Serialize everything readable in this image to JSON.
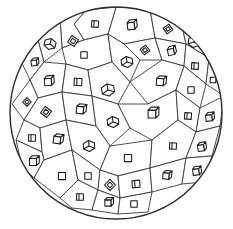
{
  "figure": {
    "background_color": "#ffffff",
    "stroke_color": "#2b2b2b",
    "cell_stroke_color": "#3a3a3a",
    "cube_stroke_color": "#1a1a1a",
    "boundary": {
      "shape": "circle",
      "center_x": 116,
      "center_y": 113,
      "radius": 106,
      "stroke_width": 1.4
    },
    "cell_count": 36,
    "cube_count": 36,
    "cells": [
      {
        "id": 1,
        "points": "116,7 150,9 155,38 124,44 108,34",
        "cube": {
          "x": 131,
          "y": 26,
          "size": 9,
          "style": "box-front",
          "rot": -6
        }
      },
      {
        "id": 2,
        "points": "150,9 180,17 186,44 155,38",
        "cube": {
          "x": 168,
          "y": 29,
          "size": 8,
          "style": "diamond",
          "rot": 10
        }
      },
      {
        "id": 3,
        "points": "180,17 205,33 209,58 186,44",
        "cube": {
          "x": 194,
          "y": 42,
          "size": 9,
          "style": "box-iso",
          "rot": 8
        }
      },
      {
        "id": 4,
        "points": "205,33 219,58 214,80 209,58",
        "cube": {
          "x": 211,
          "y": 57,
          "size": 7,
          "style": "box-front",
          "rot": -10
        }
      },
      {
        "id": 5,
        "points": "86,10 116,7 108,34 84,40 74,24",
        "cube": {
          "x": 95,
          "y": 24,
          "size": 8,
          "style": "box-flat",
          "rot": 4
        }
      },
      {
        "id": 6,
        "points": "60,18 86,10 74,24 84,40 62,48",
        "cube": {
          "x": 73,
          "y": 41,
          "size": 9,
          "style": "diamond",
          "rot": -12
        }
      },
      {
        "id": 7,
        "points": "36,33 60,18 62,48 44,62",
        "cube": {
          "x": 50,
          "y": 44,
          "size": 9,
          "style": "box-iso",
          "rot": 14
        }
      },
      {
        "id": 8,
        "points": "18,55 36,33 44,62 30,80",
        "cube": {
          "x": 34,
          "y": 63,
          "size": 7,
          "style": "box-front",
          "rot": -5
        }
      },
      {
        "id": 9,
        "points": "84,40 108,34 112,62 88,70 66,64 62,48",
        "cube": {
          "x": 84,
          "y": 55,
          "size": 8,
          "style": "square",
          "rot": 0
        }
      },
      {
        "id": 10,
        "points": "108,34 124,44 140,60 130,82 112,62",
        "cube": {
          "x": 127,
          "y": 62,
          "size": 9,
          "style": "box-iso",
          "rot": -8
        }
      },
      {
        "id": 11,
        "points": "124,44 155,38 162,60 140,60",
        "cube": {
          "x": 145,
          "y": 50,
          "size": 8,
          "style": "diamond",
          "rot": 6
        }
      },
      {
        "id": 12,
        "points": "155,38 186,44 184,66 162,60",
        "cube": {
          "x": 171,
          "y": 52,
          "size": 8,
          "style": "box-front",
          "rot": -14
        }
      },
      {
        "id": 13,
        "points": "186,44 209,58 206,84 184,66",
        "cube": {
          "x": 195,
          "y": 66,
          "size": 8,
          "style": "box-flat",
          "rot": 3
        }
      },
      {
        "id": 14,
        "points": "209,58 219,58 224,96 206,84",
        "cube": {
          "x": 213,
          "y": 80,
          "size": 7,
          "style": "square",
          "rot": 0
        }
      },
      {
        "id": 15,
        "points": "30,80 44,62 66,64 62,92 38,98",
        "cube": {
          "x": 48,
          "y": 82,
          "size": 9,
          "style": "box-front",
          "rot": -4
        }
      },
      {
        "id": 16,
        "points": "66,64 88,70 92,96 62,92",
        "cube": {
          "x": 78,
          "y": 82,
          "size": 9,
          "style": "box-flat",
          "rot": 2
        }
      },
      {
        "id": 17,
        "points": "88,70 112,62 130,82 118,104 92,96",
        "cube": {
          "x": 108,
          "y": 90,
          "size": 10,
          "style": "box-iso",
          "rot": -10
        }
      },
      {
        "id": 18,
        "points": "130,82 162,60 184,66 176,90 148,104",
        "cube": {
          "x": 160,
          "y": 82,
          "size": 9,
          "style": "box-front",
          "rot": 5
        }
      },
      {
        "id": 19,
        "points": "184,66 206,84 200,108 176,90",
        "cube": {
          "x": 191,
          "y": 90,
          "size": 8,
          "style": "square",
          "rot": 0
        }
      },
      {
        "id": 20,
        "points": "12,104 30,80 38,98 24,120",
        "cube": {
          "x": 27,
          "y": 102,
          "size": 7,
          "style": "diamond",
          "rot": 0
        }
      },
      {
        "id": 21,
        "points": "38,98 62,92 66,120 40,128 24,120",
        "cube": {
          "x": 46,
          "y": 112,
          "size": 9,
          "style": "diamond",
          "rot": -8
        }
      },
      {
        "id": 22,
        "points": "62,92 92,96 96,126 66,120",
        "cube": {
          "x": 80,
          "y": 110,
          "size": 9,
          "style": "box-front",
          "rot": 6
        }
      },
      {
        "id": 23,
        "points": "92,96 118,104 130,128 110,146 96,126",
        "cube": {
          "x": 113,
          "y": 122,
          "size": 9,
          "style": "box-iso",
          "rot": -6
        }
      },
      {
        "id": 24,
        "points": "118,104 148,104 176,90 178,120 152,140 130,128",
        "cube": {
          "x": 152,
          "y": 114,
          "size": 10,
          "style": "box-front",
          "rot": 0
        }
      },
      {
        "id": 25,
        "points": "176,90 200,108 196,132 178,120",
        "cube": {
          "x": 188,
          "y": 116,
          "size": 8,
          "style": "box-flat",
          "rot": 4
        }
      },
      {
        "id": 26,
        "points": "200,108 224,96 220,126 196,132",
        "cube": {
          "x": 209,
          "y": 118,
          "size": 8,
          "style": "box-front",
          "rot": -6
        }
      },
      {
        "id": 27,
        "points": "24,120 40,128 42,152 16,140",
        "cube": {
          "x": 32,
          "y": 138,
          "size": 8,
          "style": "box-flat",
          "rot": 0
        }
      },
      {
        "id": 28,
        "points": "40,128 66,120 72,150 44,160 42,152",
        "cube": {
          "x": 57,
          "y": 140,
          "size": 9,
          "style": "box-front",
          "rot": 8
        }
      },
      {
        "id": 29,
        "points": "66,120 96,126 110,146 100,170 72,150",
        "cube": {
          "x": 89,
          "y": 146,
          "size": 9,
          "style": "box-iso",
          "rot": -4
        }
      },
      {
        "id": 30,
        "points": "110,146 152,140 150,168 118,176 100,170",
        "cube": {
          "x": 128,
          "y": 158,
          "size": 9,
          "style": "square",
          "rot": 0
        }
      },
      {
        "id": 31,
        "points": "152,140 178,120 196,132 186,158 150,168",
        "cube": {
          "x": 173,
          "y": 146,
          "size": 8,
          "style": "box-flat",
          "rot": 2
        }
      },
      {
        "id": 32,
        "points": "196,132 220,126 212,156 186,158",
        "cube": {
          "x": 201,
          "y": 148,
          "size": 8,
          "style": "box-front",
          "rot": -8
        }
      },
      {
        "id": 33,
        "points": "16,140 42,152 44,160 34,178 22,166",
        "cube": {
          "x": 33,
          "y": 162,
          "size": 9,
          "style": "box-front",
          "rot": 0
        }
      },
      {
        "id": 34,
        "points": "44,160 72,150 78,180 60,198 34,178",
        "cube": {
          "x": 62,
          "y": 176,
          "size": 9,
          "style": "square",
          "rot": 0
        }
      },
      {
        "id": 35,
        "points": "72,150 100,170 98,190 78,180",
        "cube": {
          "x": 88,
          "y": 176,
          "size": 8,
          "style": "square",
          "rot": 0
        }
      },
      {
        "id": 36,
        "points": "100,170 118,176 120,198 98,190",
        "cube": {
          "x": 110,
          "y": 185,
          "size": 9,
          "style": "diamond",
          "rot": 0
        }
      },
      {
        "id": 37,
        "points": "118,176 150,168 152,192 120,198",
        "cube": {
          "x": 136,
          "y": 184,
          "size": 9,
          "style": "box-flat",
          "rot": -4
        }
      },
      {
        "id": 38,
        "points": "150,168 186,158 182,184 152,192",
        "cube": {
          "x": 166,
          "y": 176,
          "size": 8,
          "style": "box-front",
          "rot": 6
        }
      },
      {
        "id": 39,
        "points": "186,158 212,156 204,182 182,184",
        "cube": {
          "x": 196,
          "y": 172,
          "size": 8,
          "style": "box-front",
          "rot": -6
        }
      },
      {
        "id": 40,
        "points": "60,198 78,180 98,190 92,210 72,208",
        "cube": {
          "x": 80,
          "y": 197,
          "size": 8,
          "style": "box-flat",
          "rot": 0
        }
      },
      {
        "id": 41,
        "points": "98,190 120,198 118,214 92,210",
        "cube": {
          "x": 108,
          "y": 203,
          "size": 8,
          "style": "box-front",
          "rot": 0
        }
      },
      {
        "id": 42,
        "points": "120,198 152,192 148,212 118,214",
        "cube": {
          "x": 134,
          "y": 204,
          "size": 8,
          "style": "square",
          "rot": 0
        }
      }
    ]
  }
}
